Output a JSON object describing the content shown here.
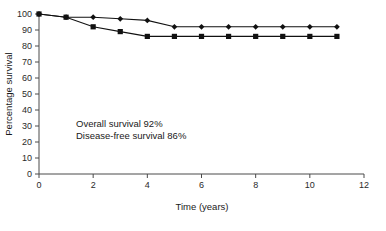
{
  "chart_data": {
    "type": "line",
    "title": "",
    "xlabel": "Time (years)",
    "ylabel": "Percentage survival",
    "xlim": [
      0,
      12
    ],
    "ylim": [
      0,
      100
    ],
    "xticks": [
      0,
      2,
      4,
      6,
      8,
      10,
      12
    ],
    "yticks": [
      0,
      10,
      20,
      30,
      40,
      50,
      60,
      70,
      80,
      90,
      100
    ],
    "xtick_labels": [
      "0",
      "2",
      "4",
      "6",
      "8",
      "10",
      "12"
    ],
    "ytick_labels": [
      "0",
      "10",
      "20",
      "30",
      "40",
      "50",
      "60",
      "70",
      "80",
      "90",
      "100"
    ],
    "grid": false,
    "legend_position": "none",
    "x": [
      0,
      1,
      2,
      3,
      4,
      5,
      6,
      7,
      8,
      9,
      10,
      11
    ],
    "series": [
      {
        "name": "Overall survival",
        "marker": "diamond",
        "values": [
          100,
          98,
          98,
          97,
          96,
          92,
          92,
          92,
          92,
          92,
          92,
          92
        ]
      },
      {
        "name": "Disease-free survival",
        "marker": "square",
        "values": [
          100,
          98,
          92,
          89,
          86,
          86,
          86,
          86,
          86,
          86,
          86,
          86
        ]
      }
    ],
    "annotations": [
      "Overall survival 92%",
      "Disease-free survival 86%"
    ]
  },
  "annotation": {
    "line1": "Overall survival 92%",
    "line2": "Disease-free survival 86%"
  },
  "axes": {
    "x_title": "Time (years)",
    "y_title": "Percentage survival"
  }
}
